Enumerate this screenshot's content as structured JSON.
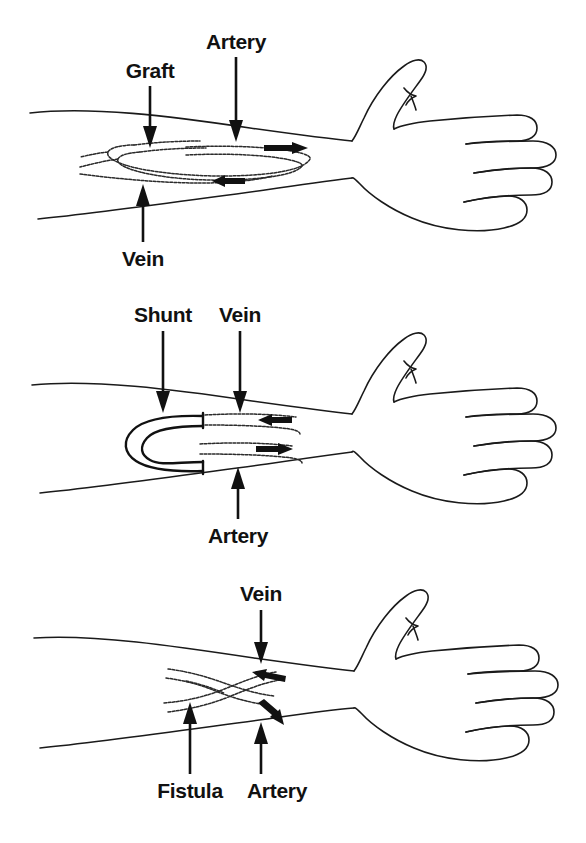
{
  "figure": {
    "background_color": "#ffffff",
    "ink_color": "#111111",
    "panel_count": 3
  },
  "panels": [
    {
      "id": "graft",
      "name": "AV Graft",
      "labels": [
        {
          "key": "graft",
          "text": "Graft",
          "x": 150,
          "y": 75,
          "anchor": "middle",
          "arrow": "down"
        },
        {
          "key": "artery",
          "text": "Artery",
          "x": 249,
          "y": 46,
          "anchor": "middle",
          "arrow": "down"
        },
        {
          "key": "vein",
          "text": "Vein",
          "x": 143,
          "y": 262,
          "anchor": "middle",
          "arrow": "up"
        }
      ],
      "flow_arrows": [
        {
          "key": "artery-flow",
          "direction": "right"
        },
        {
          "key": "vein-flow",
          "direction": "left"
        }
      ]
    },
    {
      "id": "shunt",
      "name": "External Shunt",
      "labels": [
        {
          "key": "shunt",
          "text": "Shunt",
          "x": 137,
          "y": 38,
          "anchor": "middle",
          "arrow": "down"
        },
        {
          "key": "vein",
          "text": "Vein",
          "x": 248,
          "y": 38,
          "anchor": "middle",
          "arrow": "down"
        },
        {
          "key": "artery",
          "text": "Artery",
          "x": 244,
          "y": 256,
          "anchor": "middle",
          "arrow": "up"
        }
      ],
      "flow_arrows": [
        {
          "key": "vein-flow",
          "direction": "left"
        },
        {
          "key": "artery-flow",
          "direction": "right"
        }
      ]
    },
    {
      "id": "fistula",
      "name": "AV Fistula",
      "labels": [
        {
          "key": "vein",
          "text": "Vein",
          "x": 265,
          "y": 36,
          "anchor": "middle",
          "arrow": "down"
        },
        {
          "key": "fistula",
          "text": "Fistula",
          "x": 190,
          "y": 232,
          "anchor": "middle",
          "arrow": "up"
        },
        {
          "key": "artery",
          "text": "Artery",
          "x": 277,
          "y": 232,
          "anchor": "middle",
          "arrow": "up"
        }
      ],
      "flow_arrows": [
        {
          "key": "vein-flow",
          "direction": "left"
        },
        {
          "key": "artery-flow",
          "direction": "down-right"
        }
      ]
    }
  ]
}
